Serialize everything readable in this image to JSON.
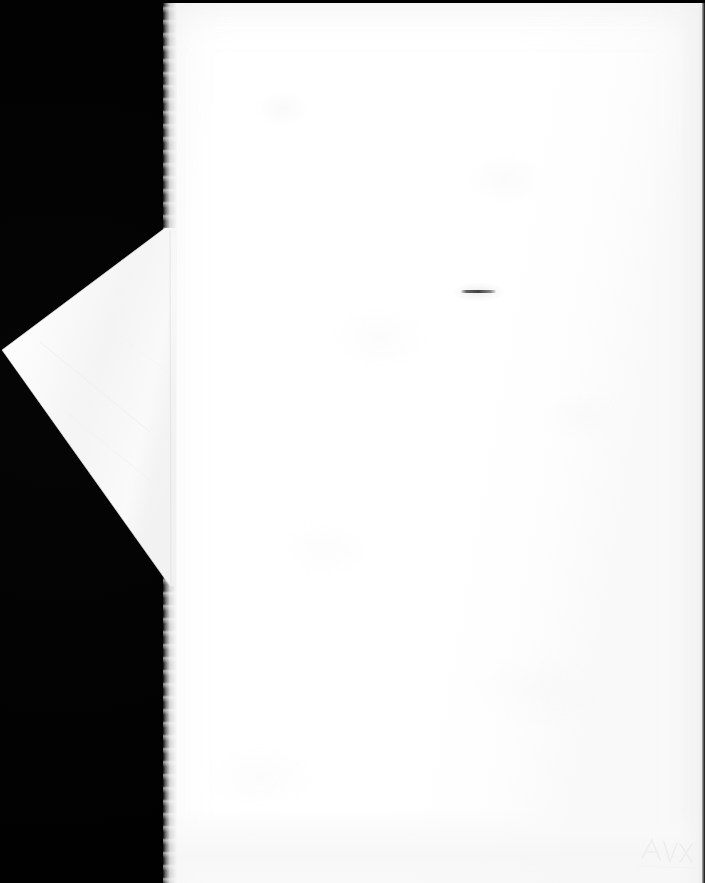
{
  "document": {
    "kind": "scanned-page",
    "caption": "",
    "page_text": "",
    "visible_text": [],
    "colors": {
      "scanner_background": "#000000",
      "paper": "#ffffff",
      "paper_shadow": "#f3f3f3",
      "fold_face": "#fafafa",
      "ink_mark": "#3a3a3a"
    }
  },
  "page": {
    "left": 163,
    "top": 3,
    "width": 542,
    "height": 880,
    "content": ""
  },
  "corner_fold": {
    "label": "",
    "apex_x": 0,
    "apex_y": 350,
    "top_vertex_x": 165,
    "top_vertex_y": 228,
    "bottom_vertex_x": 172,
    "bottom_vertex_y": 586
  },
  "marks": [
    {
      "name": "ink-dash",
      "label": "",
      "x": 461,
      "y": 289,
      "width": 35,
      "height": 6
    },
    {
      "name": "faint-handwriting",
      "label": "",
      "x": 636,
      "y": 832,
      "width": 66,
      "height": 44
    }
  ]
}
